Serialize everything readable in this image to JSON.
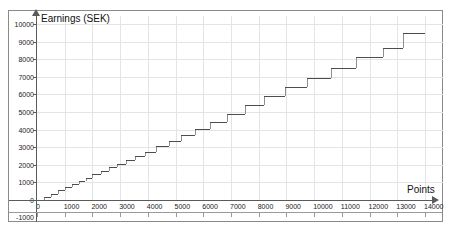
{
  "chart_data": {
    "type": "line",
    "title": "",
    "xlabel": "Points",
    "ylabel": "Earnings (SEK)",
    "xlim": [
      0,
      14000
    ],
    "ylim": [
      -1000,
      10000
    ],
    "grid": true,
    "legend": "none",
    "xticks": [
      0,
      1000,
      2000,
      3000,
      4000,
      5000,
      6000,
      7000,
      8000,
      9000,
      10000,
      11000,
      12000,
      13000,
      14000
    ],
    "yticks": [
      -1000,
      0,
      1000,
      2000,
      3000,
      4000,
      5000,
      6000,
      7000,
      8000,
      9000,
      10000
    ],
    "series": [
      {
        "name": "Earnings",
        "steps": [
          {
            "x_start": 0,
            "x_end": 250,
            "y": 0
          },
          {
            "x_start": 250,
            "x_end": 500,
            "y": 180
          },
          {
            "x_start": 500,
            "x_end": 750,
            "y": 360
          },
          {
            "x_start": 750,
            "x_end": 1000,
            "y": 540
          },
          {
            "x_start": 1000,
            "x_end": 1250,
            "y": 720
          },
          {
            "x_start": 1250,
            "x_end": 1500,
            "y": 900
          },
          {
            "x_start": 1500,
            "x_end": 1750,
            "y": 1080
          },
          {
            "x_start": 1750,
            "x_end": 2000,
            "y": 1260
          },
          {
            "x_start": 2000,
            "x_end": 2300,
            "y": 1450
          },
          {
            "x_start": 2300,
            "x_end": 2600,
            "y": 1650
          },
          {
            "x_start": 2600,
            "x_end": 2900,
            "y": 1850
          },
          {
            "x_start": 2900,
            "x_end": 3200,
            "y": 2060
          },
          {
            "x_start": 3200,
            "x_end": 3550,
            "y": 2280
          },
          {
            "x_start": 3550,
            "x_end": 3900,
            "y": 2500
          },
          {
            "x_start": 3900,
            "x_end": 4300,
            "y": 2750
          },
          {
            "x_start": 4300,
            "x_end": 4750,
            "y": 3050
          },
          {
            "x_start": 4750,
            "x_end": 5200,
            "y": 3350
          },
          {
            "x_start": 5200,
            "x_end": 5700,
            "y": 3700
          },
          {
            "x_start": 5700,
            "x_end": 6250,
            "y": 4050
          },
          {
            "x_start": 6250,
            "x_end": 6850,
            "y": 4450
          },
          {
            "x_start": 6850,
            "x_end": 7500,
            "y": 4900
          },
          {
            "x_start": 7500,
            "x_end": 8200,
            "y": 5400
          },
          {
            "x_start": 8200,
            "x_end": 8950,
            "y": 5900
          },
          {
            "x_start": 8950,
            "x_end": 9750,
            "y": 6400
          },
          {
            "x_start": 9750,
            "x_end": 10600,
            "y": 6950
          },
          {
            "x_start": 10600,
            "x_end": 11500,
            "y": 7500
          },
          {
            "x_start": 11500,
            "x_end": 12500,
            "y": 8100
          },
          {
            "x_start": 12500,
            "x_end": 13200,
            "y": 8650
          },
          {
            "x_start": 13200,
            "x_end": 14000,
            "y": 9500
          }
        ]
      }
    ]
  }
}
